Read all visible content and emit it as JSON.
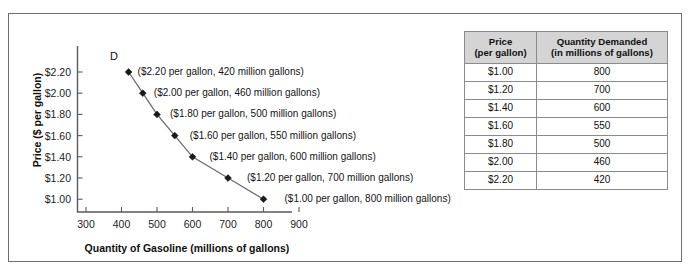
{
  "figure": {
    "border_color": "#6e6e6e",
    "background": "#ffffff"
  },
  "chart_data": {
    "type": "line",
    "title": "",
    "subtitle": "",
    "xlabel": "Quantity of Gasoline (millions of gallons)",
    "ylabel": "Price ($ per gallon)",
    "xlim": [
      300,
      900
    ],
    "ylim": [
      1.0,
      2.2
    ],
    "grid": false,
    "legend_position": "inline-curve-label",
    "curve_label": "D",
    "marker": "diamond",
    "line_color": "#6d6d6d",
    "marker_color": "#1a1a1a",
    "x_ticks": [
      "300",
      "400",
      "500",
      "600",
      "700",
      "800",
      "900"
    ],
    "x_tick_values": [
      300,
      400,
      500,
      600,
      700,
      800,
      900
    ],
    "y_ticks": [
      "$1.00",
      "$1.20",
      "$1.40",
      "$1.60",
      "$1.80",
      "$2.00",
      "$2.20"
    ],
    "y_tick_values": [
      1.0,
      1.2,
      1.4,
      1.6,
      1.8,
      2.0,
      2.2
    ],
    "x": [
      420,
      460,
      500,
      550,
      600,
      700,
      800
    ],
    "y": [
      2.2,
      2.0,
      1.8,
      1.6,
      1.4,
      1.2,
      1.0
    ],
    "series": [
      {
        "name": "D",
        "points": [
          {
            "x": 420,
            "y": 2.2
          },
          {
            "x": 460,
            "y": 2.0
          },
          {
            "x": 500,
            "y": 1.8
          },
          {
            "x": 550,
            "y": 1.6
          },
          {
            "x": 600,
            "y": 1.4
          },
          {
            "x": 700,
            "y": 1.2
          },
          {
            "x": 800,
            "y": 1.0
          }
        ]
      }
    ],
    "annotations": [
      "($2.20 per gallon, 420 million gallons)",
      "($2.00 per gallon, 460 million gallons)",
      "($1.80 per gallon, 500 million gallons)",
      "($1.60 per gallon, 550 million gallons)",
      "($1.40 per gallon, 600 million gallons)",
      "($1.20 per gallon, 700 million gallons)",
      "($1.00 per gallon, 800 million gallons)"
    ]
  },
  "table": {
    "header_background": "#d4d4d4",
    "columns": [
      {
        "line1": "Price",
        "line2": "(per gallon)"
      },
      {
        "line1": "Quantity Demanded",
        "line2": "(in millions of gallons)"
      }
    ],
    "rows": [
      {
        "price": "$1.00",
        "quantity": "800"
      },
      {
        "price": "$1.20",
        "quantity": "700"
      },
      {
        "price": "$1.40",
        "quantity": "600"
      },
      {
        "price": "$1.60",
        "quantity": "550"
      },
      {
        "price": "$1.80",
        "quantity": "500"
      },
      {
        "price": "$2.00",
        "quantity": "460"
      },
      {
        "price": "$2.20",
        "quantity": "420"
      }
    ]
  }
}
